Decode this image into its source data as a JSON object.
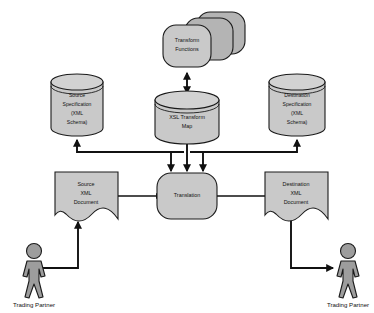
{
  "diagram": {
    "type": "flow-diagram",
    "background_color": "#ffffff",
    "node_fill_color": "#c9c9c9",
    "node_stroke_color": "#1a1a1a",
    "actor_fill_color": "#9d9d9d",
    "connector_color": "#111111",
    "nodes": {
      "transform_functions": {
        "shape": "stacked-rounded-rectangles",
        "stack_count": 3,
        "line1": "Transform",
        "line2": "Functions"
      },
      "xsl_transform_map": {
        "shape": "cylinder",
        "line1": "XSL Transform",
        "line2": "Map"
      },
      "source_specification": {
        "shape": "cylinder",
        "line1": "Source",
        "line2": "Specification",
        "line3": "(XML",
        "line4": "Schema)"
      },
      "destination_specification": {
        "shape": "cylinder",
        "line1": "Destination",
        "line2": "Specification",
        "line3": "(XML",
        "line4": "Schema)"
      },
      "source_document": {
        "shape": "torn-document",
        "line1": "Source",
        "line2": "XML",
        "line3": "Document"
      },
      "destination_document": {
        "shape": "torn-document",
        "line1": "Destination",
        "line2": "XML",
        "line3": "Document"
      },
      "translation": {
        "shape": "rounded-rectangle",
        "line1": "Translation"
      },
      "actor_left": {
        "shape": "stick-figure",
        "label": "Trading Partner"
      },
      "actor_right": {
        "shape": "stick-figure",
        "label": "Trading Partner"
      }
    },
    "connectors": [
      {
        "from": "xsl_transform_map",
        "to": "transform_functions",
        "style": "double-arrow"
      },
      {
        "from": "xsl_transform_map",
        "to": "translation",
        "style": "arrow"
      },
      {
        "from": "translation_bus_left",
        "to": "source_specification",
        "style": "arrow"
      },
      {
        "from": "translation_bus_right",
        "to": "destination_specification",
        "style": "arrow"
      },
      {
        "from": "source_specification_bus",
        "to": "translation",
        "style": "arrow"
      },
      {
        "from": "destination_specification_bus",
        "to": "translation",
        "style": "arrow"
      },
      {
        "from": "source_document",
        "to": "translation",
        "style": "arrow"
      },
      {
        "from": "translation",
        "to": "destination_document",
        "style": "arrow"
      },
      {
        "from": "actor_left",
        "to": "source_document",
        "style": "arrow"
      },
      {
        "from": "destination_document",
        "to": "actor_right",
        "style": "arrow"
      }
    ]
  }
}
